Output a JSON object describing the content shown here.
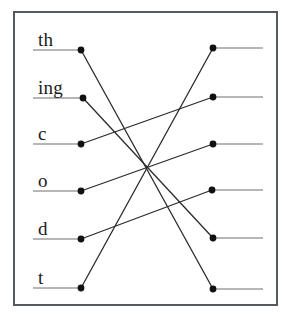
{
  "figure": {
    "type": "bipartite-matching-diagram",
    "background_color": "#ffffff",
    "frame_color": "#555a5f",
    "line_color": "#2b2b2b",
    "stub_color": "#6e6e6e",
    "node_color": "#111111",
    "width": 292,
    "height": 318
  },
  "left_nodes": [
    {
      "id": "L1",
      "label": "th",
      "x": 81,
      "y": 50,
      "stub_x": 33,
      "label_x": 38,
      "label_y": 30
    },
    {
      "id": "L2",
      "label": "ing",
      "x": 83,
      "y": 98,
      "stub_x": 33,
      "label_x": 38,
      "label_y": 78
    },
    {
      "id": "L3",
      "label": "c",
      "x": 81,
      "y": 144,
      "stub_x": 33,
      "label_x": 38,
      "label_y": 124
    },
    {
      "id": "L4",
      "label": "o",
      "x": 81,
      "y": 191,
      "stub_x": 33,
      "label_x": 38,
      "label_y": 171
    },
    {
      "id": "L5",
      "label": "d",
      "x": 81,
      "y": 239,
      "stub_x": 33,
      "label_x": 38,
      "label_y": 219
    },
    {
      "id": "L6",
      "label": "t",
      "x": 81,
      "y": 288,
      "stub_x": 33,
      "label_x": 38,
      "label_y": 268
    }
  ],
  "right_nodes": [
    {
      "id": "R1",
      "x": 213,
      "y": 48,
      "stub_x": 263
    },
    {
      "id": "R2",
      "x": 213,
      "y": 97,
      "stub_x": 263
    },
    {
      "id": "R3",
      "x": 213,
      "y": 144,
      "stub_x": 263
    },
    {
      "id": "R4",
      "x": 212,
      "y": 190,
      "stub_x": 263
    },
    {
      "id": "R5",
      "x": 213,
      "y": 238,
      "stub_x": 263
    },
    {
      "id": "R6",
      "x": 213,
      "y": 289,
      "stub_x": 263
    }
  ],
  "edges": [
    {
      "from": "L1",
      "to": "R6",
      "from_label": "th",
      "x1": 81,
      "y1": 50,
      "x2": 213,
      "y2": 289
    },
    {
      "from": "L2",
      "to": "R5",
      "from_label": "ing",
      "x1": 83,
      "y1": 98,
      "x2": 213,
      "y2": 238
    },
    {
      "from": "L3",
      "to": "R2",
      "from_label": "c",
      "x1": 81,
      "y1": 144,
      "x2": 213,
      "y2": 97
    },
    {
      "from": "L4",
      "to": "R3",
      "from_label": "o",
      "x1": 81,
      "y1": 191,
      "x2": 213,
      "y2": 144
    },
    {
      "from": "L5",
      "to": "R4",
      "from_label": "d",
      "x1": 81,
      "y1": 239,
      "x2": 212,
      "y2": 190
    },
    {
      "from": "L6",
      "to": "R1",
      "from_label": "t",
      "x1": 81,
      "y1": 288,
      "x2": 213,
      "y2": 48
    }
  ],
  "top_mark": {
    "text": ""
  }
}
